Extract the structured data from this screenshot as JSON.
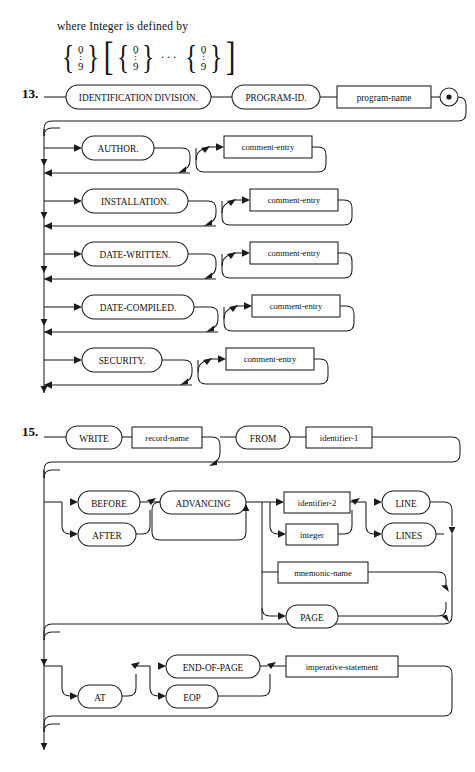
{
  "page": {
    "width": 475,
    "height": 772,
    "background": "#ffffff",
    "ink": "#1b1b1b",
    "kind": "syntax-railroad-diagrams"
  },
  "intro": {
    "text": "where Integer is defined by",
    "formula": {
      "description": "brace stack 0 over 9, bracketed repetition of brace stack 0 over 9, ellipsis, brace stack 0 over 9",
      "digit_top": "0",
      "digit_dots": "⋮",
      "digit_bottom": "9",
      "ellipsis": "···",
      "open_brace": "{",
      "close_brace": "}",
      "open_bracket": "[",
      "close_bracket": "]"
    }
  },
  "diagrams": [
    {
      "number": "13.",
      "name": "identification-division",
      "nodes": [
        {
          "id": "identification-division",
          "label": "IDENTIFICATION DIVISION.",
          "shape": "terminal"
        },
        {
          "id": "program-id",
          "label": "PROGRAM-ID.",
          "shape": "terminal"
        },
        {
          "id": "program-name",
          "label": "program-name",
          "shape": "nonterminal"
        },
        {
          "id": "period",
          "label": "•",
          "shape": "period"
        },
        {
          "id": "author",
          "label": "AUTHOR.",
          "shape": "terminal"
        },
        {
          "id": "comment-entry-author",
          "label": "comment-entry",
          "shape": "nonterminal"
        },
        {
          "id": "installation",
          "label": "INSTALLATION.",
          "shape": "terminal"
        },
        {
          "id": "comment-entry-installation",
          "label": "comment-entry",
          "shape": "nonterminal"
        },
        {
          "id": "date-written",
          "label": "DATE-WRITTEN.",
          "shape": "terminal"
        },
        {
          "id": "comment-entry-date-written",
          "label": "comment-entry",
          "shape": "nonterminal"
        },
        {
          "id": "date-compiled",
          "label": "DATE-COMPILED.",
          "shape": "terminal"
        },
        {
          "id": "comment-entry-date-compiled",
          "label": "comment-entry",
          "shape": "nonterminal"
        },
        {
          "id": "security",
          "label": "SECURITY.",
          "shape": "terminal"
        },
        {
          "id": "comment-entry-security",
          "label": "comment-entry",
          "shape": "nonterminal"
        }
      ]
    },
    {
      "number": "15.",
      "name": "write-statement",
      "nodes": [
        {
          "id": "write",
          "label": "WRITE",
          "shape": "terminal"
        },
        {
          "id": "record-name",
          "label": "record-name",
          "shape": "nonterminal"
        },
        {
          "id": "from",
          "label": "FROM",
          "shape": "terminal"
        },
        {
          "id": "identifier-1",
          "label": "identifier-1",
          "shape": "nonterminal"
        },
        {
          "id": "before",
          "label": "BEFORE",
          "shape": "terminal"
        },
        {
          "id": "after",
          "label": "AFTER",
          "shape": "terminal"
        },
        {
          "id": "advancing",
          "label": "ADVANCING",
          "shape": "terminal"
        },
        {
          "id": "identifier-2",
          "label": "identifier-2",
          "shape": "nonterminal"
        },
        {
          "id": "integer",
          "label": "integer",
          "shape": "nonterminal"
        },
        {
          "id": "line",
          "label": "LINE",
          "shape": "terminal"
        },
        {
          "id": "lines",
          "label": "LINES",
          "shape": "terminal"
        },
        {
          "id": "mnemonic-name",
          "label": "mnemonic-name",
          "shape": "nonterminal"
        },
        {
          "id": "page",
          "label": "PAGE",
          "shape": "terminal"
        },
        {
          "id": "at",
          "label": "AT",
          "shape": "terminal"
        },
        {
          "id": "end-of-page",
          "label": "END-OF-PAGE",
          "shape": "terminal"
        },
        {
          "id": "eop",
          "label": "EOP",
          "shape": "terminal"
        },
        {
          "id": "imperative-statement",
          "label": "imperative-statement",
          "shape": "nonterminal"
        }
      ]
    }
  ],
  "labels": {
    "identification_division": "IDENTIFICATION DIVISION.",
    "program_id": "PROGRAM-ID.",
    "program_name": "program-name",
    "author": "AUTHOR.",
    "installation": "INSTALLATION.",
    "date_written": "DATE-WRITTEN.",
    "date_compiled": "DATE-COMPILED.",
    "security": "SECURITY.",
    "comment_entry": "comment-entry",
    "write": "WRITE",
    "record_name": "record-name",
    "from": "FROM",
    "identifier_1": "identifier-1",
    "before": "BEFORE",
    "after": "AFTER",
    "advancing": "ADVANCING",
    "identifier_2": "identifier-2",
    "integer": "integer",
    "line": "LINE",
    "lines": "LINES",
    "mnemonic_name": "mnemonic-name",
    "page_kw": "PAGE",
    "at": "AT",
    "end_of_page": "END-OF-PAGE",
    "eop": "EOP",
    "imperative_statement": "imperative-statement",
    "num13": "13.",
    "num15": "15."
  }
}
